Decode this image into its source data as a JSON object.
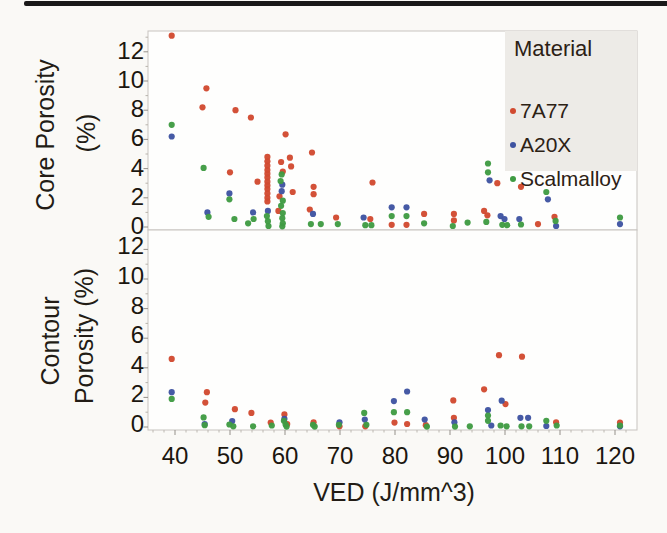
{
  "chart_data": {
    "type": "scatter",
    "xlabel": "VED (J/mm^3)",
    "x_ticks": [
      40,
      50,
      60,
      70,
      80,
      90,
      100,
      110,
      120
    ],
    "xlim": [
      35,
      124
    ],
    "grid": false,
    "legend": {
      "title": "Material",
      "position": "top-right",
      "entries": [
        {
          "label": "7A77",
          "color": "#d14a30"
        },
        {
          "label": "A20X",
          "color": "#3e53a1"
        },
        {
          "label": "Scalmalloy",
          "color": "#3f9b43"
        }
      ]
    },
    "panels": [
      {
        "ylabel_line1": "Core Porosity",
        "ylabel_line2": "(%)",
        "y_ticks": [
          0,
          2,
          4,
          6,
          8,
          10,
          12
        ],
        "ylim": [
          0,
          13.4
        ],
        "series": [
          {
            "name": "7A77",
            "color": "#d14a30",
            "points": [
              [
                39.4,
                13.1
              ],
              [
                45.0,
                8.2
              ],
              [
                45.7,
                9.5
              ],
              [
                50.0,
                3.75
              ],
              [
                51.0,
                8.0
              ],
              [
                53.8,
                7.5
              ],
              [
                55.0,
                3.1
              ],
              [
                56.8,
                4.8
              ],
              [
                56.8,
                4.5
              ],
              [
                56.8,
                4.2
              ],
              [
                56.8,
                3.9
              ],
              [
                56.8,
                3.65
              ],
              [
                56.8,
                3.4
              ],
              [
                56.8,
                3.1
              ],
              [
                56.8,
                2.85
              ],
              [
                56.8,
                2.6
              ],
              [
                56.8,
                2.3
              ],
              [
                56.8,
                2.0
              ],
              [
                56.8,
                1.75
              ],
              [
                58.8,
                1.1
              ],
              [
                59.0,
                2.1
              ],
              [
                59.3,
                4.45
              ],
              [
                59.6,
                3.8
              ],
              [
                60.1,
                6.35
              ],
              [
                60.9,
                4.75
              ],
              [
                61.1,
                4.15
              ],
              [
                61.4,
                2.4
              ],
              [
                64.5,
                1.2
              ],
              [
                64.9,
                5.1
              ],
              [
                65.2,
                2.75
              ],
              [
                65.2,
                2.25
              ],
              [
                69.3,
                0.65
              ],
              [
                75.5,
                0.55
              ],
              [
                75.9,
                3.05
              ],
              [
                79.4,
                0.15
              ],
              [
                82.1,
                0.15
              ],
              [
                85.3,
                0.9
              ],
              [
                90.7,
                0.9
              ],
              [
                90.7,
                0.45
              ],
              [
                96.2,
                1.1
              ],
              [
                96.8,
                0.8
              ],
              [
                98.6,
                3.0
              ],
              [
                102.9,
                2.75
              ],
              [
                106.0,
                0.2
              ],
              [
                109.0,
                0.7
              ]
            ]
          },
          {
            "name": "A20X",
            "color": "#3e53a1",
            "points": [
              [
                39.4,
                6.2
              ],
              [
                45.9,
                1.0
              ],
              [
                49.9,
                2.3
              ],
              [
                54.2,
                1.0
              ],
              [
                56.9,
                1.1
              ],
              [
                59.4,
                2.45
              ],
              [
                59.5,
                2.9
              ],
              [
                65.1,
                0.9
              ],
              [
                74.3,
                0.65
              ],
              [
                79.4,
                1.35
              ],
              [
                82.1,
                1.35
              ],
              [
                97.2,
                3.2
              ],
              [
                99.2,
                0.75
              ],
              [
                99.9,
                0.55
              ],
              [
                102.6,
                0.55
              ],
              [
                107.8,
                1.9
              ],
              [
                109.3,
                0.07
              ],
              [
                120.9,
                0.2
              ]
            ]
          },
          {
            "name": "Scalmalloy",
            "color": "#3f9b43",
            "points": [
              [
                39.4,
                7.0
              ],
              [
                45.2,
                4.05
              ],
              [
                46.1,
                0.7
              ],
              [
                49.9,
                1.9
              ],
              [
                50.8,
                0.55
              ],
              [
                53.3,
                0.25
              ],
              [
                54.3,
                0.55
              ],
              [
                56.7,
                0.75
              ],
              [
                56.9,
                0.4
              ],
              [
                57.0,
                0.07
              ],
              [
                59.2,
                3.15
              ],
              [
                59.4,
                3.6
              ],
              [
                59.6,
                1.8
              ],
              [
                59.3,
                1.45
              ],
              [
                59.6,
                0.95
              ],
              [
                59.5,
                0.6
              ],
              [
                59.6,
                0.25
              ],
              [
                59.5,
                0.05
              ],
              [
                64.7,
                0.2
              ],
              [
                66.5,
                0.2
              ],
              [
                69.6,
                0.2
              ],
              [
                74.6,
                0.12
              ],
              [
                75.7,
                0.12
              ],
              [
                79.4,
                0.75
              ],
              [
                82.1,
                0.75
              ],
              [
                85.3,
                0.25
              ],
              [
                90.5,
                0.07
              ],
              [
                93.2,
                0.3
              ],
              [
                96.6,
                0.35
              ],
              [
                96.9,
                4.35
              ],
              [
                96.9,
                3.75
              ],
              [
                99.5,
                0.15
              ],
              [
                100.4,
                0.12
              ],
              [
                102.9,
                0.17
              ],
              [
                107.5,
                2.4
              ],
              [
                109.2,
                0.42
              ],
              [
                120.9,
                0.65
              ]
            ]
          }
        ]
      },
      {
        "ylabel_line1": "Contour",
        "ylabel_line2": "Porosity (%)",
        "y_ticks": [
          0,
          2,
          4,
          6,
          8,
          10,
          12
        ],
        "ylim": [
          0,
          13.3
        ],
        "series": [
          {
            "name": "7A77",
            "color": "#d14a30",
            "points": [
              [
                39.4,
                4.6
              ],
              [
                45.5,
                1.65
              ],
              [
                45.8,
                2.35
              ],
              [
                50.9,
                1.2
              ],
              [
                53.9,
                0.95
              ],
              [
                57.4,
                0.3
              ],
              [
                59.9,
                0.85
              ],
              [
                60.4,
                0.2
              ],
              [
                65.2,
                0.32
              ],
              [
                69.9,
                0.05
              ],
              [
                74.6,
                0.05
              ],
              [
                79.9,
                0.3
              ],
              [
                82.2,
                0.2
              ],
              [
                85.6,
                0.12
              ],
              [
                90.6,
                1.8
              ],
              [
                90.7,
                0.62
              ],
              [
                96.2,
                2.55
              ],
              [
                98.9,
                4.85
              ],
              [
                100.1,
                1.55
              ],
              [
                103.1,
                4.75
              ],
              [
                109.3,
                0.32
              ],
              [
                120.9,
                0.3
              ]
            ]
          },
          {
            "name": "A20X",
            "color": "#3e53a1",
            "points": [
              [
                39.4,
                2.35
              ],
              [
                45.4,
                0.2
              ],
              [
                50.4,
                0.4
              ],
              [
                59.9,
                0.55
              ],
              [
                69.9,
                0.32
              ],
              [
                74.5,
                0.5
              ],
              [
                79.8,
                1.75
              ],
              [
                82.2,
                2.4
              ],
              [
                85.4,
                0.5
              ],
              [
                90.8,
                0.32
              ],
              [
                96.9,
                1.15
              ],
              [
                97.5,
                0.1
              ],
              [
                99.4,
                1.78
              ],
              [
                102.8,
                0.62
              ],
              [
                104.2,
                0.62
              ],
              [
                107.5,
                0.07
              ],
              [
                120.9,
                0.05
              ]
            ]
          },
          {
            "name": "Scalmalloy",
            "color": "#3f9b43",
            "points": [
              [
                39.4,
                1.9
              ],
              [
                45.2,
                0.65
              ],
              [
                45.4,
                0.12
              ],
              [
                49.9,
                0.17
              ],
              [
                50.6,
                0.05
              ],
              [
                54.2,
                0.05
              ],
              [
                57.6,
                0.1
              ],
              [
                59.8,
                0.42
              ],
              [
                60.1,
                0.17
              ],
              [
                60.3,
                0.03
              ],
              [
                65.1,
                0.15
              ],
              [
                65.4,
                0.03
              ],
              [
                69.8,
                0.15
              ],
              [
                74.4,
                0.95
              ],
              [
                74.8,
                0.15
              ],
              [
                79.8,
                1.0
              ],
              [
                82.2,
                1.0
              ],
              [
                85.8,
                0.03
              ],
              [
                90.9,
                0.03
              ],
              [
                93.6,
                0.05
              ],
              [
                96.9,
                0.78
              ],
              [
                96.9,
                0.42
              ],
              [
                99.2,
                0.1
              ],
              [
                100.3,
                0.05
              ],
              [
                103.0,
                0.05
              ],
              [
                104.4,
                0.05
              ],
              [
                107.5,
                0.42
              ],
              [
                109.4,
                0.1
              ],
              [
                120.9,
                0.1
              ]
            ]
          }
        ]
      }
    ]
  }
}
